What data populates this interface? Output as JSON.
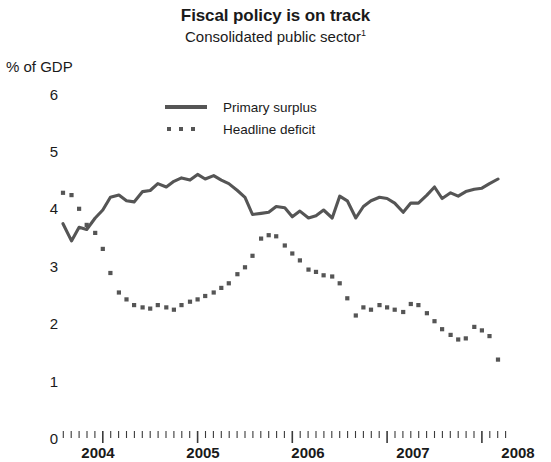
{
  "chart_data": {
    "type": "line",
    "title": "Fiscal policy is on track",
    "subtitle": "Consolidated public sector",
    "subtitle_footnote_marker": "1",
    "ylabel": "% of GDP",
    "xlabel": "",
    "ylim": [
      0,
      6
    ],
    "yticks": [
      0,
      1,
      2,
      3,
      4,
      5,
      6
    ],
    "ytick_labels": [
      "0",
      "1",
      "2",
      "3",
      "4",
      "5",
      "6"
    ],
    "xlim": [
      2003.58,
      2008.25
    ],
    "xtick_labels": [
      "2004",
      "2005",
      "2006",
      "2007",
      "2008"
    ],
    "xticks": [
      2004,
      2005,
      2006,
      2007,
      2008
    ],
    "grid": false,
    "legend_position": "upper-center",
    "line_color": "#555555",
    "series": [
      {
        "name": "Primary surplus",
        "style": "solid",
        "color": "#555555",
        "x": [
          2003.58,
          2003.67,
          2003.75,
          2003.83,
          2003.92,
          2004.0,
          2004.08,
          2004.17,
          2004.25,
          2004.33,
          2004.42,
          2004.5,
          2004.58,
          2004.67,
          2004.75,
          2004.83,
          2004.92,
          2005.0,
          2005.08,
          2005.17,
          2005.25,
          2005.33,
          2005.42,
          2005.5,
          2005.58,
          2005.67,
          2005.75,
          2005.83,
          2005.92,
          2006.0,
          2006.08,
          2006.17,
          2006.25,
          2006.33,
          2006.42,
          2006.5,
          2006.58,
          2006.67,
          2006.75,
          2006.83,
          2006.92,
          2007.0,
          2007.08,
          2007.17,
          2007.25,
          2007.33,
          2007.42,
          2007.5,
          2007.58,
          2007.67,
          2007.75,
          2007.83,
          2007.92,
          2008.0,
          2008.08,
          2008.17
        ],
        "values": [
          3.72,
          3.42,
          3.66,
          3.62,
          3.82,
          3.96,
          4.18,
          4.22,
          4.12,
          4.1,
          4.28,
          4.3,
          4.42,
          4.36,
          4.46,
          4.52,
          4.48,
          4.58,
          4.5,
          4.56,
          4.48,
          4.42,
          4.3,
          4.18,
          3.88,
          3.9,
          3.92,
          4.02,
          4.0,
          3.84,
          3.94,
          3.82,
          3.86,
          3.96,
          3.82,
          4.2,
          4.12,
          3.82,
          4.02,
          4.12,
          4.18,
          4.16,
          4.08,
          3.92,
          4.08,
          4.08,
          4.22,
          4.36,
          4.16,
          4.26,
          4.2,
          4.28,
          4.32,
          4.34,
          4.42,
          4.5
        ]
      },
      {
        "name": "Headline deficit",
        "style": "dotted",
        "color": "#555555",
        "x": [
          2003.58,
          2003.67,
          2003.75,
          2003.83,
          2003.92,
          2004.0,
          2004.08,
          2004.17,
          2004.25,
          2004.33,
          2004.42,
          2004.5,
          2004.58,
          2004.67,
          2004.75,
          2004.83,
          2004.92,
          2005.0,
          2005.08,
          2005.17,
          2005.25,
          2005.33,
          2005.42,
          2005.5,
          2005.58,
          2005.67,
          2005.75,
          2005.83,
          2005.92,
          2006.0,
          2006.08,
          2006.17,
          2006.25,
          2006.33,
          2006.42,
          2006.5,
          2006.58,
          2006.67,
          2006.75,
          2006.83,
          2006.92,
          2007.0,
          2007.08,
          2007.17,
          2007.25,
          2007.33,
          2007.42,
          2007.5,
          2007.58,
          2007.67,
          2007.75,
          2007.83,
          2007.92,
          2008.0,
          2008.08,
          2008.17
        ],
        "values": [
          4.26,
          4.22,
          3.98,
          3.7,
          3.56,
          3.28,
          2.86,
          2.52,
          2.4,
          2.3,
          2.26,
          2.24,
          2.3,
          2.26,
          2.22,
          2.3,
          2.36,
          2.4,
          2.46,
          2.52,
          2.6,
          2.68,
          2.84,
          2.96,
          3.16,
          3.46,
          3.52,
          3.5,
          3.34,
          3.2,
          3.08,
          2.92,
          2.88,
          2.82,
          2.8,
          2.68,
          2.42,
          2.12,
          2.26,
          2.22,
          2.3,
          2.26,
          2.22,
          2.18,
          2.32,
          2.3,
          2.16,
          2.02,
          1.88,
          1.78,
          1.7,
          1.72,
          1.92,
          1.86,
          1.76,
          1.35
        ]
      }
    ]
  },
  "axis": {
    "unit_label": "% of GDP"
  },
  "legend": {
    "items": [
      {
        "label": "Primary surplus",
        "style": "solid"
      },
      {
        "label": "Headline deficit",
        "style": "dotted"
      }
    ]
  }
}
